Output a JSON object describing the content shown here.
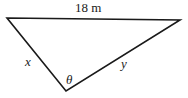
{
  "diagram": {
    "type": "triangle",
    "top_side_label": "18 m",
    "left_side_label": "x",
    "right_side_label": "y",
    "angle_label": "θ",
    "stroke_color": "#1a1a1a"
  }
}
